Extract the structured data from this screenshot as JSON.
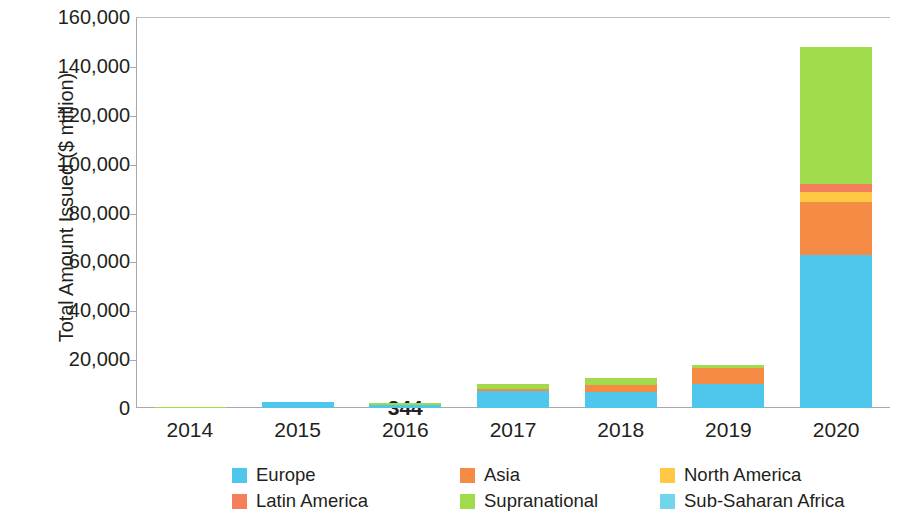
{
  "chart_data": {
    "type": "bar",
    "stacked": true,
    "title": "",
    "subtitle": "",
    "xlabel": "",
    "ylabel": "Total Amount Issued ($ million)",
    "grid": false,
    "legend_position": "bottom",
    "categories": [
      "2014",
      "2015",
      "2016",
      "2017",
      "2018",
      "2019",
      "2020"
    ],
    "ytick_labels": [
      "0",
      "20,000",
      "40,000",
      "60,000",
      "80,000",
      "100,000",
      "120,000",
      "140,000",
      "160,000"
    ],
    "ytick_values": [
      0,
      20000,
      40000,
      60000,
      80000,
      100000,
      120000,
      140000,
      160000
    ],
    "ylim": [
      0,
      160000
    ],
    "series": [
      {
        "name": "Europe",
        "color": "#4FC6EC",
        "values": [
          0,
          2600,
          1400,
          6900,
          6600,
          9900,
          62800
        ]
      },
      {
        "name": "Asia",
        "color": "#F68B45",
        "values": [
          0,
          0,
          0,
          968,
          2671,
          6505,
          21539
        ]
      },
      {
        "name": "North America",
        "color": "#FFC845",
        "values": [
          0,
          0,
          0,
          0,
          0,
          0,
          4100
        ]
      },
      {
        "name": "Latin America",
        "color": "#F57F5B",
        "values": [
          0,
          0,
          0,
          0,
          0,
          0,
          3200
        ]
      },
      {
        "name": "Supranational",
        "color": "#A0DB4B",
        "values": [
          600,
          0,
          700,
          1900,
          3200,
          1100,
          56200
        ]
      },
      {
        "name": "Sub-Saharan Africa",
        "color": "#6FD6EC",
        "values": [
          0,
          0,
          0,
          0,
          0,
          0,
          0
        ]
      }
    ],
    "annotations": [
      {
        "category": "2016",
        "series": "Europe",
        "text": "344"
      },
      {
        "category": "2017",
        "series": "Asia",
        "text": "968"
      },
      {
        "category": "2018",
        "series": "Asia",
        "text": "2,671"
      },
      {
        "category": "2019",
        "series": "Asia",
        "text": "6,505"
      },
      {
        "category": "2020",
        "series": "Asia",
        "text": "21,539"
      }
    ]
  },
  "legend": {
    "items": [
      {
        "label": "Europe",
        "color": "#4FC6EC",
        "icon": "legend-swatch-icon"
      },
      {
        "label": "Asia",
        "color": "#F68B45",
        "icon": "legend-swatch-icon"
      },
      {
        "label": "North America",
        "color": "#FFC845",
        "icon": "legend-swatch-icon"
      },
      {
        "label": "Latin America",
        "color": "#F57F5B",
        "icon": "legend-swatch-icon"
      },
      {
        "label": "Supranational",
        "color": "#A0DB4B",
        "icon": "legend-swatch-icon"
      },
      {
        "label": "Sub-Saharan Africa",
        "color": "#6FD6EC",
        "icon": "legend-swatch-icon"
      }
    ]
  }
}
